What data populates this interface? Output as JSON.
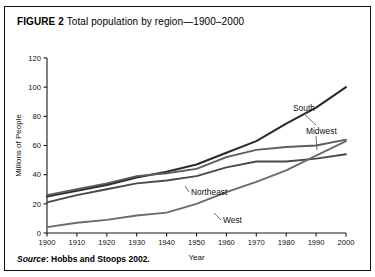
{
  "figure": {
    "label": "FIGURE 2",
    "caption": "Total population by region—1900–2000",
    "source_word": "Source",
    "source_text": ": Hobbs and Stoops 2002."
  },
  "chart_data": {
    "type": "line",
    "title": "Total population by region—1900–2000",
    "xlabel": "Year",
    "ylabel": "Millions of People",
    "xlim": [
      1900,
      2000
    ],
    "ylim": [
      0,
      120
    ],
    "yticks": [
      0,
      20,
      40,
      60,
      80,
      100,
      120
    ],
    "ytick_labels": [
      "0",
      "20",
      "40",
      "60",
      "80",
      "100",
      "120"
    ],
    "x": [
      1900,
      1910,
      1920,
      1930,
      1940,
      1950,
      1960,
      1970,
      1980,
      1990,
      2000
    ],
    "xtick_labels": [
      "1900",
      "1910",
      "1920",
      "1930",
      "1940",
      "1950",
      "1960",
      "1970",
      "1980",
      "1990",
      "2000"
    ],
    "grid": false,
    "legend": "inline-labels",
    "series": [
      {
        "name": "South",
        "color": "#2b2b2b",
        "values": [
          25,
          29,
          33,
          38,
          42,
          47,
          55,
          63,
          75,
          86,
          100
        ],
        "label_x": 1965,
        "label_y": 86
      },
      {
        "name": "Midwest",
        "color": "#5d5d5d",
        "values": [
          26,
          30,
          34,
          39,
          41,
          44,
          52,
          57,
          59,
          60,
          64
        ],
        "label_x": 1970,
        "label_y": 70
      },
      {
        "name": "Northeast",
        "color": "#4a4a4a",
        "values": [
          21,
          26,
          30,
          34,
          36,
          39,
          45,
          49,
          49,
          51,
          54
        ],
        "label_x": 1938,
        "label_y": 32
      },
      {
        "name": "West",
        "color": "#6b6b6b",
        "values": [
          4,
          7,
          9,
          12,
          14,
          20,
          28,
          35,
          43,
          53,
          63
        ],
        "label_x": 1952,
        "label_y": 13
      }
    ]
  }
}
